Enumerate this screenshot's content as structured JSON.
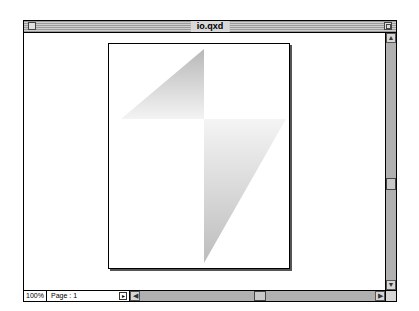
{
  "window": {
    "title": "io.qxd"
  },
  "statusbar": {
    "zoom_level": "100%",
    "page_label": "Page : 1",
    "page_menu_icon": "triangle-right-icon"
  },
  "scrollbars": {
    "vertical_up_icon": "arrow-up-icon",
    "vertical_down_icon": "arrow-down-icon",
    "horizontal_left_icon": "arrow-left-icon",
    "horizontal_right_icon": "arrow-right-icon"
  },
  "document": {
    "shape": "kite",
    "fill_colors": [
      "#b8b8b8",
      "#f4f4f4",
      "#b8b8b8"
    ]
  }
}
